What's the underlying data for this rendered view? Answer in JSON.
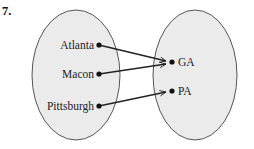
{
  "problem_number": "7.",
  "domain_set": {
    "fill": "#ebebeb",
    "stroke": "#555555",
    "elements": [
      {
        "label": "Atlanta",
        "x": 99,
        "y": 45
      },
      {
        "label": "Macon",
        "x": 99,
        "y": 74
      },
      {
        "label": "Pittsburgh",
        "x": 99,
        "y": 106
      }
    ]
  },
  "range_set": {
    "fill": "#ebebeb",
    "stroke": "#555555",
    "elements": [
      {
        "label": "GA",
        "x": 172,
        "y": 62
      },
      {
        "label": "PA",
        "x": 172,
        "y": 91
      }
    ]
  },
  "mappings": [
    {
      "from": "Atlanta",
      "to": "GA"
    },
    {
      "from": "Macon",
      "to": "GA"
    },
    {
      "from": "Pittsburgh",
      "to": "PA"
    }
  ]
}
